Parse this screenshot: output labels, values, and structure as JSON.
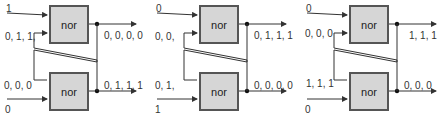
{
  "diagram": {
    "type": "cross-coupled NOR latch (SR latch) timing states",
    "gate_label": "nor",
    "colors": {
      "gate_fill": "#d6d6d6",
      "gate_stroke": "#555555",
      "wire": "#333333",
      "text": "#333333"
    },
    "panels": [
      {
        "top_input": "1",
        "top_feedback_input": "0, 1, 1,",
        "top_output": "0, 0, 0, 0",
        "bottom_feedback_input": "0, 0, 0",
        "bottom_output": "0, 1, 1, 1",
        "bottom_input": "0"
      },
      {
        "top_input": "0",
        "top_feedback_input": "0, 0,",
        "top_output": "0, 1, 1, 1",
        "bottom_feedback_input": "0, 1,",
        "bottom_output": "0, 0, 0, 0",
        "bottom_input": "1"
      },
      {
        "top_input": "0",
        "top_feedback_input": "0, 0, 0",
        "top_output": "1, 1, 1",
        "bottom_feedback_input": "1, 1, 1",
        "bottom_output": "0, 0, 0",
        "bottom_input": "0"
      }
    ]
  }
}
